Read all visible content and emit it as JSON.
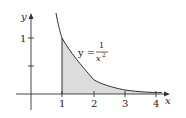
{
  "figure": {
    "equation": {
      "lhs": "y =",
      "numerator": "1",
      "denominator": "x",
      "exponent": "2"
    },
    "axes": {
      "x_label": "x",
      "y_label": "y"
    },
    "x_ticks": [
      "1",
      "2",
      "3",
      "4"
    ],
    "y_ticks": [
      "1"
    ],
    "shaded_region": {
      "from": 1,
      "to": 4,
      "color": "#d9d9d9"
    },
    "curve_color": "#333333"
  }
}
